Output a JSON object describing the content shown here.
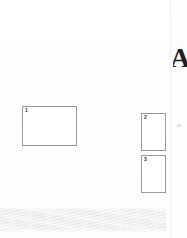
{
  "page": {
    "background_color": "#ffffff",
    "width": 187,
    "height": 238
  },
  "figure_boxes": [
    {
      "number": "1",
      "label": "1",
      "border_color": "#9a9a9a",
      "fill_color": "#ffffff",
      "shape": "landscape-rectangle"
    },
    {
      "number": "2",
      "label": "2",
      "border_color": "#9a9a9a",
      "fill_color": "#ffffff",
      "shape": "portrait-rectangle"
    },
    {
      "number": "3",
      "label": "3",
      "border_color": "#9a9a9a",
      "fill_color": "#ffffff",
      "shape": "portrait-rectangle"
    }
  ],
  "edge_mark": {
    "glyph": "A",
    "description": "partial-letterform-cut-off-at-right-edge",
    "color": "#1f1f1f"
  },
  "bottom_band": {
    "description": "wavy-diagonal-striped-gray-band",
    "stripe_color": "#e6e6e6",
    "background_color": "#f4f4f4"
  },
  "gutter": {
    "description": "scan-page-edge",
    "color": "#fdfdfd",
    "line_color": "#f2f2f2"
  }
}
